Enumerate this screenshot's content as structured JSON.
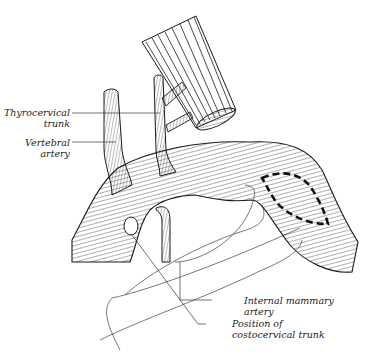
{
  "diagram": {
    "colors": {
      "ink": "#1a1a1a",
      "background": "#ffffff",
      "leader": "#333333"
    },
    "labels": [
      {
        "id": "thyrocervical",
        "line1": "Thyrocervical",
        "line2": "trunk"
      },
      {
        "id": "vertebral",
        "line1": "Vertebral",
        "line2": "artery"
      },
      {
        "id": "internal-mammary",
        "line1": "Internal mammary",
        "line2": "artery"
      },
      {
        "id": "costocervical",
        "line1": "Position of",
        "line2": "costocervical trunk"
      }
    ],
    "annotations": [
      {
        "id": "dashed-region",
        "description": "dashed outline on distal subclavian artery"
      },
      {
        "id": "costocervical-oval",
        "description": "oval marking position of costocervical trunk"
      }
    ]
  }
}
